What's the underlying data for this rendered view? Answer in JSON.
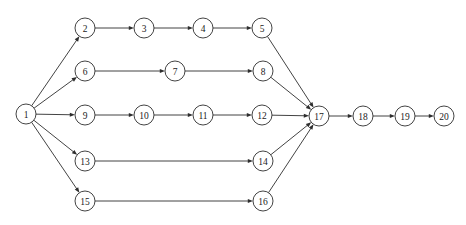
{
  "diagram": {
    "kind": "directed-graph",
    "title": "",
    "background_color": "#ffffff",
    "stroke_color": "#2e2e2e",
    "node_fill_color": "#ffffff",
    "label_color": "#1a1a1a",
    "node_radius": 10,
    "canvas": {
      "width": 466,
      "height": 225
    }
  },
  "chart_data": {
    "type": "diagram",
    "title": "",
    "xlabel": "",
    "ylabel": "",
    "nodes": [
      {
        "id": 1,
        "label": "1",
        "x": 26,
        "y": 114
      },
      {
        "id": 2,
        "label": "2",
        "x": 85,
        "y": 28
      },
      {
        "id": 3,
        "label": "3",
        "x": 144,
        "y": 28
      },
      {
        "id": 4,
        "label": "4",
        "x": 203,
        "y": 28
      },
      {
        "id": 5,
        "label": "5",
        "x": 262,
        "y": 28
      },
      {
        "id": 6,
        "label": "6",
        "x": 85,
        "y": 71
      },
      {
        "id": 7,
        "label": "7",
        "x": 175,
        "y": 71
      },
      {
        "id": 8,
        "label": "8",
        "x": 263,
        "y": 71
      },
      {
        "id": 9,
        "label": "9",
        "x": 85,
        "y": 115
      },
      {
        "id": 10,
        "label": "10",
        "x": 144,
        "y": 115
      },
      {
        "id": 11,
        "label": "11",
        "x": 203,
        "y": 115
      },
      {
        "id": 12,
        "label": "12",
        "x": 262,
        "y": 115
      },
      {
        "id": 13,
        "label": "13",
        "x": 85,
        "y": 161
      },
      {
        "id": 14,
        "label": "14",
        "x": 263,
        "y": 161
      },
      {
        "id": 15,
        "label": "15",
        "x": 85,
        "y": 201
      },
      {
        "id": 16,
        "label": "16",
        "x": 263,
        "y": 201
      },
      {
        "id": 17,
        "label": "17",
        "x": 319,
        "y": 116
      },
      {
        "id": 18,
        "label": "18",
        "x": 363,
        "y": 116
      },
      {
        "id": 19,
        "label": "19",
        "x": 405,
        "y": 116
      },
      {
        "id": 20,
        "label": "20",
        "x": 444,
        "y": 116
      }
    ],
    "edges": [
      {
        "from": 1,
        "to": 2,
        "directed": true
      },
      {
        "from": 1,
        "to": 6,
        "directed": true
      },
      {
        "from": 1,
        "to": 9,
        "directed": true
      },
      {
        "from": 1,
        "to": 13,
        "directed": true
      },
      {
        "from": 1,
        "to": 15,
        "directed": true
      },
      {
        "from": 2,
        "to": 3,
        "directed": true
      },
      {
        "from": 3,
        "to": 4,
        "directed": true
      },
      {
        "from": 4,
        "to": 5,
        "directed": true
      },
      {
        "from": 6,
        "to": 7,
        "directed": true
      },
      {
        "from": 7,
        "to": 8,
        "directed": true
      },
      {
        "from": 9,
        "to": 10,
        "directed": true
      },
      {
        "from": 10,
        "to": 11,
        "directed": true
      },
      {
        "from": 11,
        "to": 12,
        "directed": true
      },
      {
        "from": 13,
        "to": 14,
        "directed": true
      },
      {
        "from": 15,
        "to": 16,
        "directed": true
      },
      {
        "from": 5,
        "to": 17,
        "directed": true
      },
      {
        "from": 8,
        "to": 17,
        "directed": true
      },
      {
        "from": 12,
        "to": 17,
        "directed": true
      },
      {
        "from": 14,
        "to": 17,
        "directed": true
      },
      {
        "from": 16,
        "to": 17,
        "directed": true
      },
      {
        "from": 17,
        "to": 18,
        "directed": true
      },
      {
        "from": 18,
        "to": 19,
        "directed": true
      },
      {
        "from": 19,
        "to": 20,
        "directed": true
      }
    ]
  }
}
